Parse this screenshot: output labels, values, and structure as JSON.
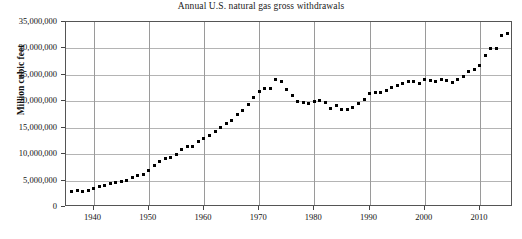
{
  "chart_data": {
    "type": "scatter",
    "title": "Annual U.S. natural gas gross withdrawals",
    "xlabel": "",
    "ylabel": "Million cubic feet",
    "xlim": [
      1935,
      2016
    ],
    "ylim": [
      0,
      35000000
    ],
    "grid": true,
    "legend": "none",
    "marker": "square",
    "marker_color": "#000000",
    "y_ticks": [
      0,
      5000000,
      10000000,
      15000000,
      20000000,
      25000000,
      30000000,
      35000000
    ],
    "y_tick_labels": [
      "0",
      "5,000,000",
      "10,000,000",
      "15,000,000",
      "20,000,000",
      "25,000,000",
      "30,000,000",
      "35,000,000"
    ],
    "x_ticks": [
      1940,
      1950,
      1960,
      1970,
      1980,
      1990,
      2000,
      2010
    ],
    "x_tick_labels": [
      "1940",
      "1950",
      "1960",
      "1970",
      "1980",
      "1990",
      "2000",
      "2010"
    ],
    "x": [
      1936,
      1937,
      1938,
      1939,
      1940,
      1941,
      1942,
      1943,
      1944,
      1945,
      1946,
      1947,
      1948,
      1949,
      1950,
      1951,
      1952,
      1953,
      1954,
      1955,
      1956,
      1957,
      1958,
      1959,
      1960,
      1961,
      1962,
      1963,
      1964,
      1965,
      1966,
      1967,
      1968,
      1969,
      1970,
      1971,
      1972,
      1973,
      1974,
      1975,
      1976,
      1977,
      1978,
      1979,
      1980,
      1981,
      1982,
      1983,
      1984,
      1985,
      1986,
      1987,
      1988,
      1989,
      1990,
      1991,
      1992,
      1993,
      1994,
      1995,
      1996,
      1997,
      1998,
      1999,
      2000,
      2001,
      2002,
      2003,
      2004,
      2005,
      2006,
      2007,
      2008,
      2009,
      2010,
      2011,
      2012,
      2013,
      2014,
      2015
    ],
    "y": [
      2900000,
      3100000,
      3000000,
      3200000,
      3500000,
      3800000,
      4100000,
      4400000,
      4700000,
      4800000,
      5000000,
      5500000,
      6000000,
      6200000,
      6900000,
      7900000,
      8600000,
      9200000,
      9400000,
      10000000,
      10800000,
      11400000,
      11400000,
      12400000,
      13000000,
      13500000,
      14300000,
      15000000,
      15800000,
      16300000,
      17500000,
      18200000,
      19300000,
      20700000,
      21900000,
      22500000,
      22500000,
      24100000,
      23800000,
      22200000,
      21100000,
      20000000,
      19700000,
      19500000,
      19900000,
      20200000,
      19800000,
      18600000,
      19200000,
      18500000,
      18400000,
      18900000,
      19500000,
      20300000,
      21500000,
      21700000,
      21600000,
      22100000,
      22700000,
      22900000,
      23400000,
      23700000,
      23800000,
      23300000,
      24200000,
      24000000,
      23700000,
      24100000,
      23900000,
      23500000,
      24200000,
      24600000,
      25600000,
      26000000,
      26800000,
      28600000,
      30000000,
      30000000,
      32400000,
      32800000
    ]
  }
}
